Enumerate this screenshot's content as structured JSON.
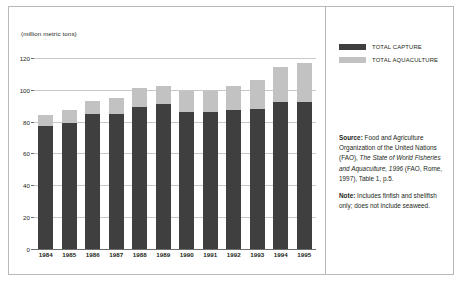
{
  "chart_data": {
    "type": "bar",
    "stacked": true,
    "title": "",
    "subtitle": "",
    "xlabel": "",
    "ylabel": "",
    "unit_caption": "(million metric tons)",
    "categories": [
      "1984",
      "1985",
      "1986",
      "1987",
      "1988",
      "1989",
      "1990",
      "1991",
      "1992",
      "1993",
      "1994",
      "1995"
    ],
    "series": [
      {
        "name": "TOTAL CAPTURE",
        "color": "#3f3f3f",
        "values": [
          77,
          79,
          85,
          85,
          89,
          91,
          86,
          86,
          87,
          88,
          92,
          92
        ]
      },
      {
        "name": "TOTAL AQUACULTURE",
        "color": "#c2c2c2",
        "values": [
          7,
          8,
          8,
          10,
          12,
          11,
          13,
          13,
          15,
          18,
          22,
          25
        ]
      }
    ],
    "totals": [
      84,
      87,
      93,
      95,
      101,
      102,
      99,
      99,
      102,
      106,
      114,
      117
    ],
    "ylim": [
      0,
      128
    ],
    "yticks": [
      0,
      20,
      40,
      60,
      80,
      100,
      120
    ],
    "ytick_labels": [
      "0",
      "20",
      "40",
      "60",
      "80",
      "100",
      "120"
    ],
    "grid": true,
    "legend_position": "top-right"
  },
  "legend": {
    "items": [
      {
        "label": "TOTAL CAPTURE",
        "color": "#3f3f3f"
      },
      {
        "label": "TOTAL AQUACULTURE",
        "color": "#c2c2c2"
      }
    ]
  },
  "notes": {
    "source_lead": "Source:",
    "source_part1": " Food and Agriculture Organization of the United Nations (FAO), ",
    "source_italic": "The State of World Fisheries and Aquaculture, 1996",
    "source_part2": " (FAO, Rome, 1997), Table 1, p.5.",
    "note_lead": "Note:",
    "note_text": " Includes finfish and shellfish only; does not include seaweed."
  }
}
